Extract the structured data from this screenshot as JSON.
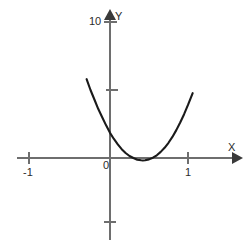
{
  "figure": {
    "background_color": "#ffffff",
    "axis_color": "#6e6e6e",
    "curve_color": "#1a1a1a",
    "text_color": "#2b2b2b"
  },
  "axis_labels": {
    "x_name": "X",
    "y_name": "Y"
  },
  "ticks": {
    "x": [
      {
        "value": -1,
        "label": "-1"
      },
      {
        "value": 0,
        "label": "0"
      },
      {
        "value": 1,
        "label": "1"
      }
    ],
    "y": [
      {
        "value": 10,
        "label": "10"
      },
      {
        "value": 5,
        "label": ""
      },
      {
        "value": -5,
        "label": ""
      }
    ]
  },
  "chart_data": {
    "type": "line",
    "title": "",
    "subtitle": "",
    "xlabel": "X",
    "ylabel": "Y",
    "xlim": [
      -1.2,
      1.65
    ],
    "ylim": [
      -5.8,
      10.7
    ],
    "grid": false,
    "legend": null,
    "annotations": [],
    "series": [
      {
        "name": "parabola",
        "equation": "y = 11.6x^2 - 9.7x + 1.85",
        "color": "#1a1a1a",
        "x": [
          -0.3,
          -0.25,
          -0.2,
          -0.15,
          -0.1,
          -0.05,
          0.0,
          0.05,
          0.1,
          0.15,
          0.2,
          0.25,
          0.3,
          0.35,
          0.4,
          0.42,
          0.45,
          0.5,
          0.55,
          0.6,
          0.65,
          0.7,
          0.75,
          0.8,
          0.85,
          0.9,
          0.95,
          1.0,
          1.06
        ],
        "values": [
          5.8,
          5.0,
          4.3,
          3.6,
          3.0,
          2.4,
          1.85,
          1.4,
          1.0,
          0.65,
          0.37,
          0.15,
          0.0,
          -0.13,
          -0.17,
          -0.18,
          -0.17,
          -0.1,
          0.02,
          0.2,
          0.45,
          0.75,
          1.12,
          1.55,
          2.05,
          2.61,
          3.22,
          3.9,
          4.77
        ]
      }
    ],
    "axes_style": {
      "x_axis_y_value": 0,
      "y_axis_x_value": 0,
      "x_arrow": true,
      "y_arrow": true,
      "spine": "crossed-origin"
    }
  }
}
